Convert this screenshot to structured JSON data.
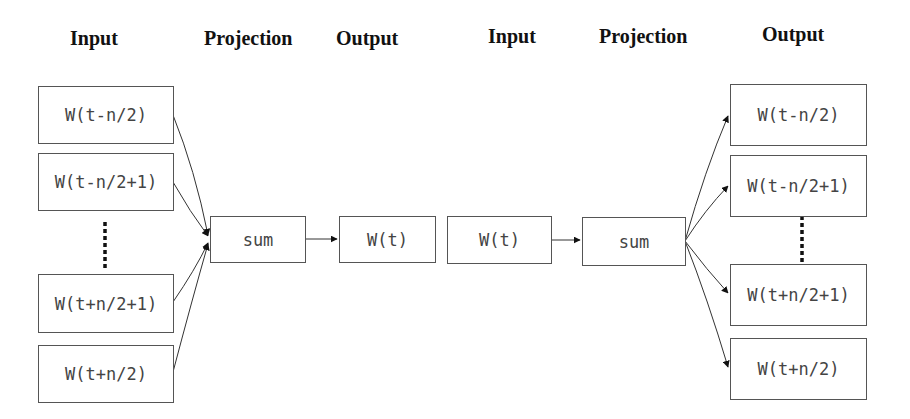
{
  "cbow": {
    "headers": {
      "input": "Input",
      "projection": "Projection",
      "output": "Output"
    },
    "inputs": [
      {
        "label": "W(t-n/2)"
      },
      {
        "label": "W(t-n/2+1)"
      },
      {
        "label": "W(t+n/2+1)"
      },
      {
        "label": "W(t+n/2)"
      }
    ],
    "projection": {
      "label": "sum"
    },
    "output": {
      "label": "W(t)"
    }
  },
  "skipgram": {
    "headers": {
      "input": "Input",
      "projection": "Projection",
      "output": "Output"
    },
    "input": {
      "label": "W(t)"
    },
    "projection": {
      "label": "sum"
    },
    "outputs": [
      {
        "label": "W(t-n/2)"
      },
      {
        "label": "W(t-n/2+1)"
      },
      {
        "label": "W(t+n/2+1)"
      },
      {
        "label": "W(t+n/2)"
      }
    ]
  }
}
